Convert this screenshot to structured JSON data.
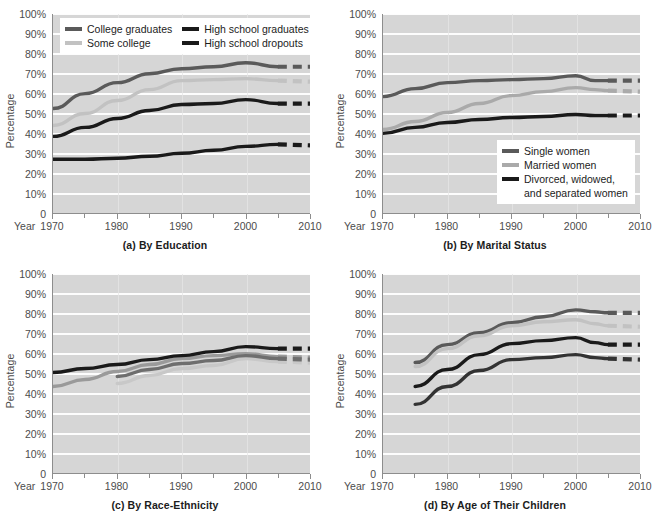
{
  "figure": {
    "width": 660,
    "height": 520,
    "background": "#ffffff"
  },
  "axis": {
    "ylabel": "Percentage",
    "year_word": "Year",
    "yticks": [
      "100%",
      "90%",
      "80%",
      "70%",
      "60%",
      "50%",
      "40%",
      "30%",
      "20%",
      "10%",
      "0"
    ],
    "xticks": [
      "1970",
      "1980",
      "1990",
      "2000",
      "2010"
    ],
    "xticks_minor": [
      1975,
      1985,
      1995,
      2005
    ],
    "ylim": [
      0,
      100
    ],
    "xlim": [
      1970,
      2010
    ],
    "grid": "horizontal-white",
    "plot_background": "#d6d6d6"
  },
  "colors": {
    "dark": "#1a1a1a",
    "medium_dark": "#5a5a5a",
    "medium": "#8f8f8f",
    "light": "#c2c2c2",
    "plot_bg": "#d6d6d6",
    "gridline": "#fdfdfd",
    "axis": "#8d8d8d",
    "text": "#4c4c4c",
    "caption": "#1c1c1c"
  },
  "panels": [
    {
      "id": "a",
      "caption": "(a) By Education",
      "legend_layout": "two-column",
      "legend": [
        {
          "label": "College graduates",
          "color": "#5a5a5a"
        },
        {
          "label": "Some college",
          "color": "#c2c2c2"
        },
        {
          "label": "High school graduates",
          "color": "#1a1a1a"
        },
        {
          "label": "High school dropouts",
          "color": "#1a1a1a"
        }
      ]
    },
    {
      "id": "b",
      "caption": "(b) By Marital Status",
      "legend_layout": "single-column",
      "legend": [
        {
          "label": "Single women",
          "color": "#5a5a5a"
        },
        {
          "label": "Married women",
          "color": "#aaaaaa"
        },
        {
          "label": "Divorced, widowed,",
          "label2": "and separated women",
          "color": "#1a1a1a"
        }
      ]
    },
    {
      "id": "c",
      "caption": "(c) By Race-Ethnicity",
      "legend_layout": "single-column",
      "legend": [
        {
          "label": "Whites",
          "color": "#9a9a9a"
        },
        {
          "label": "African Americans",
          "color": "#1a1a1a"
        },
        {
          "label": "Latinas",
          "color": "#c8c8c8"
        },
        {
          "label": "Asian Americans",
          "color": "#6e6e6e"
        }
      ]
    },
    {
      "id": "d",
      "caption": "(d) By Age of Their Children",
      "legend_layout": "single-column",
      "legend": [
        {
          "label": "Ages 14–17",
          "color": "#5a5a5a"
        },
        {
          "label": "Ages 6–13",
          "color": "#c2c2c2"
        },
        {
          "label": "Ages 3–5",
          "color": "#1a1a1a"
        },
        {
          "label": "Under age 3",
          "color": "#333333"
        }
      ]
    }
  ],
  "chart_data": [
    {
      "type": "line",
      "panel": "a",
      "title": "(a) By Education",
      "xlabel": "Year",
      "ylabel": "Percentage",
      "xlim": [
        1970,
        2010
      ],
      "ylim": [
        0,
        100
      ],
      "grid": true,
      "legend_position": "top-left",
      "x": [
        1970,
        1975,
        1980,
        1985,
        1990,
        1995,
        2000,
        2005
      ],
      "x_projected": [
        2005,
        2010
      ],
      "series": [
        {
          "name": "College graduates",
          "color": "#5a5a5a",
          "values": [
            52.5,
            60.0,
            65.5,
            70.0,
            72.5,
            73.5,
            75.5,
            73.5
          ],
          "projected": [
            73.5,
            73.5
          ]
        },
        {
          "name": "Some college",
          "color": "#c2c2c2",
          "values": [
            44.0,
            50.0,
            56.5,
            62.0,
            66.5,
            67.0,
            67.5,
            66.5
          ],
          "projected": [
            66.5,
            66.0
          ]
        },
        {
          "name": "High school graduates",
          "color": "#1a1a1a",
          "values": [
            38.5,
            43.0,
            47.5,
            51.5,
            54.5,
            55.0,
            57.0,
            55.0
          ],
          "projected": [
            55.0,
            55.0
          ]
        },
        {
          "name": "High school dropouts",
          "color": "#1a1a1a",
          "values": [
            27.0,
            27.0,
            27.5,
            28.5,
            30.0,
            31.5,
            33.5,
            34.5
          ],
          "projected": [
            34.5,
            34.0
          ]
        }
      ]
    },
    {
      "type": "line",
      "panel": "b",
      "title": "(b) By Marital Status",
      "xlabel": "Year",
      "ylabel": "Percentage",
      "xlim": [
        1970,
        2010
      ],
      "ylim": [
        0,
        100
      ],
      "grid": true,
      "legend_position": "bottom-right",
      "x": [
        1970,
        1975,
        1980,
        1985,
        1990,
        1995,
        2000,
        2003,
        2005
      ],
      "x_projected": [
        2005,
        2010
      ],
      "series": [
        {
          "name": "Single women",
          "color": "#5a5a5a",
          "values": [
            58.5,
            62.5,
            65.5,
            66.5,
            67.0,
            67.5,
            69.0,
            66.5,
            66.5
          ],
          "projected": [
            66.5,
            66.5
          ]
        },
        {
          "name": "Married women",
          "color": "#aaaaaa",
          "values": [
            42.0,
            46.0,
            50.5,
            55.0,
            59.0,
            61.0,
            63.0,
            62.0,
            61.5
          ],
          "projected": [
            61.5,
            61.0
          ]
        },
        {
          "name": "Divorced, widowed, and separated women",
          "color": "#1a1a1a",
          "values": [
            40.0,
            43.0,
            45.5,
            47.0,
            48.0,
            48.5,
            49.5,
            49.0,
            49.0
          ],
          "projected": [
            49.0,
            49.0
          ]
        }
      ]
    },
    {
      "type": "line",
      "panel": "c",
      "title": "(c) By Race-Ethnicity",
      "xlabel": "Year",
      "ylabel": "Percentage",
      "xlim": [
        1970,
        2010
      ],
      "ylim": [
        0,
        100
      ],
      "grid": true,
      "legend_position": "top-left",
      "x": [
        1970,
        1975,
        1980,
        1985,
        1990,
        1995,
        2000,
        2005
      ],
      "x_projected": [
        2005,
        2010
      ],
      "series": [
        {
          "name": "Whites",
          "color": "#9a9a9a",
          "values": [
            43.5,
            47.0,
            51.0,
            54.5,
            57.5,
            59.0,
            60.0,
            58.5
          ],
          "projected": [
            58.5,
            58.0
          ]
        },
        {
          "name": "African Americans",
          "color": "#1a1a1a",
          "values": [
            50.5,
            52.5,
            54.5,
            57.0,
            59.0,
            61.0,
            63.5,
            62.5
          ],
          "projected": [
            62.5,
            62.5
          ]
        },
        {
          "name": "Latinas",
          "color": "#c8c8c8",
          "values": [
            null,
            null,
            45.0,
            49.0,
            52.5,
            54.0,
            57.5,
            56.0
          ],
          "projected": [
            56.0,
            55.5
          ]
        },
        {
          "name": "Asian Americans",
          "color": "#6e6e6e",
          "values": [
            null,
            null,
            48.5,
            52.0,
            55.0,
            56.5,
            59.0,
            57.5
          ],
          "projected": [
            57.5,
            57.0
          ]
        }
      ]
    },
    {
      "type": "line",
      "panel": "d",
      "title": "(d) By Age of Their Children",
      "xlabel": "Year",
      "ylabel": "Percentage",
      "xlim": [
        1970,
        2010
      ],
      "ylim": [
        0,
        100
      ],
      "grid": true,
      "legend_position": "bottom-right",
      "x": [
        1975,
        1980,
        1985,
        1990,
        1995,
        2000,
        2003,
        2005
      ],
      "x_projected": [
        2005,
        2010
      ],
      "series": [
        {
          "name": "Ages 14–17",
          "color": "#5a5a5a",
          "values": [
            55.5,
            64.5,
            70.5,
            75.5,
            78.5,
            82.0,
            81.0,
            80.5
          ],
          "projected": [
            80.5,
            80.5
          ]
        },
        {
          "name": "Ages 6–13",
          "color": "#c2c2c2",
          "values": [
            53.5,
            62.5,
            69.0,
            74.0,
            76.0,
            77.0,
            75.0,
            74.0
          ],
          "projected": [
            74.0,
            73.5
          ]
        },
        {
          "name": "Ages 3–5",
          "color": "#1a1a1a",
          "values": [
            43.5,
            52.0,
            59.5,
            65.0,
            66.5,
            68.0,
            65.5,
            64.5
          ],
          "projected": [
            64.5,
            64.5
          ]
        },
        {
          "name": "Under age 3",
          "color": "#333333",
          "values": [
            34.5,
            43.5,
            51.5,
            57.0,
            58.0,
            59.5,
            58.0,
            57.5
          ],
          "projected": [
            57.5,
            57.0
          ]
        }
      ]
    }
  ]
}
